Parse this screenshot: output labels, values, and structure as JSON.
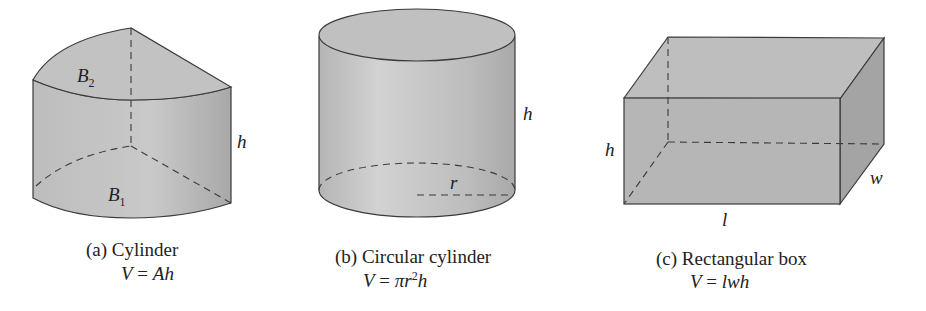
{
  "figures": [
    {
      "id": "a",
      "caption": "(a) Cylinder",
      "formula_lhs": "V",
      "formula_eq": "=",
      "formula_rhs": "Ah",
      "labels": {
        "top_base": "B",
        "top_base_sub": "2",
        "bottom_base": "B",
        "bottom_base_sub": "1",
        "height": "h"
      }
    },
    {
      "id": "b",
      "caption": "(b) Circular cylinder",
      "formula_lhs": "V",
      "formula_eq": "=",
      "formula_rhs_pre": "πr",
      "formula_rhs_sup": "2",
      "formula_rhs_post": "h",
      "labels": {
        "height": "h",
        "radius": "r"
      }
    },
    {
      "id": "c",
      "caption": "(c) Rectangular box",
      "formula_lhs": "V",
      "formula_eq": "=",
      "formula_rhs": "lwh",
      "labels": {
        "height": "h",
        "width": "w",
        "length": "l"
      }
    }
  ],
  "colors": {
    "fill_light": "#c4c4c4",
    "fill_mid": "#b0b0b0",
    "fill_dark": "#9a9a9a",
    "stroke": "#3a3a3a"
  }
}
